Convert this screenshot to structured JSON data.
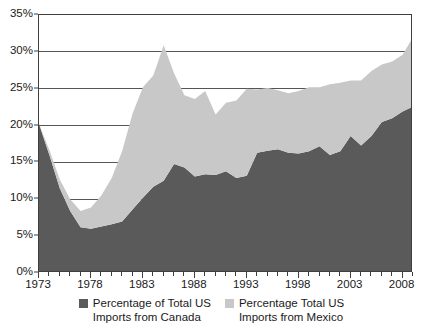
{
  "chart_data": {
    "type": "area",
    "stacked": true,
    "title": "",
    "subtitle": "",
    "xlabel": "",
    "ylabel": "",
    "xlim": [
      1973,
      2009
    ],
    "ylim": [
      0,
      35
    ],
    "y_tick_labels": [
      "0%",
      "5%",
      "10%",
      "15%",
      "20%",
      "25%",
      "30%",
      "35%"
    ],
    "y_tick_values": [
      0,
      5,
      10,
      15,
      20,
      25,
      30,
      35
    ],
    "x_tick_labels": [
      "1973",
      "1978",
      "1983",
      "1988",
      "1993",
      "1998",
      "2003",
      "2008"
    ],
    "x_tick_values": [
      1973,
      1978,
      1983,
      1988,
      1993,
      1998,
      2003,
      2008
    ],
    "grid": "horizontal",
    "legend_position": "bottom",
    "colors": {
      "canada": "#5a5a5a",
      "mexico": "#c8c8c8",
      "axis": "#3f3f3f",
      "grid": "#555555",
      "background": "#ffffff",
      "text": "#1a1a1a"
    },
    "x": [
      1973,
      1974,
      1975,
      1976,
      1977,
      1978,
      1979,
      1980,
      1981,
      1982,
      1983,
      1984,
      1985,
      1986,
      1987,
      1988,
      1989,
      1990,
      1991,
      1992,
      1993,
      1994,
      1995,
      1996,
      1997,
      1998,
      1999,
      2000,
      2001,
      2002,
      2003,
      2004,
      2005,
      2006,
      2007,
      2008,
      2009
    ],
    "series": [
      {
        "name": "Percentage of Total US Imports from Canada",
        "key": "canada",
        "color": "#5a5a5a",
        "values": [
          20.2,
          16.0,
          11.5,
          8.4,
          6.2,
          6.0,
          6.3,
          6.6,
          7.0,
          8.6,
          10.2,
          11.7,
          12.5,
          14.8,
          14.3,
          13.1,
          13.4,
          13.3,
          13.8,
          12.9,
          13.2,
          16.3,
          16.6,
          16.8,
          16.3,
          16.2,
          16.5,
          17.2,
          16.0,
          16.5,
          18.6,
          17.3,
          18.6,
          20.5,
          21.0,
          21.9,
          22.6
        ]
      },
      {
        "name": "Percentage Total US Imports from Mexico",
        "key": "mexico",
        "color": "#c8c8c8",
        "values": [
          0.0,
          0.7,
          1.2,
          1.6,
          2.2,
          2.9,
          4.2,
          6.3,
          9.5,
          13.0,
          15.0,
          15.1,
          18.4,
          12.3,
          9.8,
          10.5,
          11.3,
          8.2,
          9.3,
          10.5,
          11.8,
          8.6,
          8.5,
          8.0,
          8.1,
          8.5,
          8.7,
          8.0,
          9.6,
          9.3,
          7.5,
          8.8,
          8.8,
          7.8,
          7.7,
          7.7,
          9.4
        ]
      }
    ]
  },
  "y_axis": {
    "ticks": [
      {
        "label": "0%",
        "value": 0
      },
      {
        "label": "5%",
        "value": 5
      },
      {
        "label": "10%",
        "value": 10
      },
      {
        "label": "15%",
        "value": 15
      },
      {
        "label": "20%",
        "value": 20
      },
      {
        "label": "25%",
        "value": 25
      },
      {
        "label": "30%",
        "value": 30
      },
      {
        "label": "35%",
        "value": 35
      }
    ]
  },
  "x_axis": {
    "ticks": [
      {
        "label": "1973",
        "value": 1973
      },
      {
        "label": "1978",
        "value": 1978
      },
      {
        "label": "1983",
        "value": 1983
      },
      {
        "label": "1988",
        "value": 1988
      },
      {
        "label": "1993",
        "value": 1993
      },
      {
        "label": "1998",
        "value": 1998
      },
      {
        "label": "2003",
        "value": 2003
      },
      {
        "label": "2008",
        "value": 2008
      }
    ]
  },
  "legend": {
    "entries": [
      {
        "label": "Percentage of Total US\nImports from Canada",
        "color": "#5a5a5a",
        "key": "canada"
      },
      {
        "label": "Percentage Total US\nImports from Mexico",
        "color": "#c8c8c8",
        "key": "mexico"
      }
    ]
  }
}
